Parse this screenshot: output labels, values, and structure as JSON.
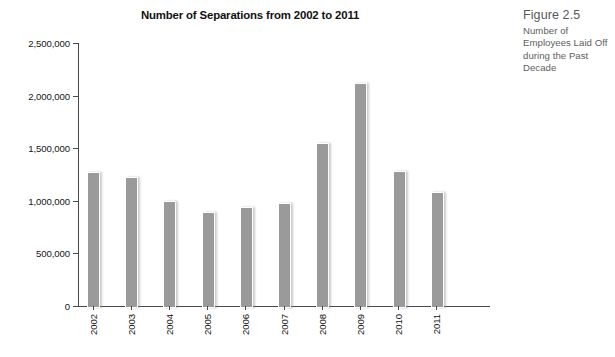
{
  "caption": {
    "figure_label": "Figure 2.5",
    "description": "Number of Employees Laid Off during the Past Decade"
  },
  "chart_data": {
    "type": "bar",
    "title": "Number of Separations from 2002 to 2011",
    "xlabel": "",
    "ylabel": "",
    "categories": [
      "2002",
      "2003",
      "2004",
      "2005",
      "2006",
      "2007",
      "2008",
      "2009",
      "2010",
      "2011"
    ],
    "values": [
      1275000,
      1225000,
      1000000,
      890000,
      940000,
      975000,
      1545000,
      2120000,
      1285000,
      1085000
    ],
    "ylim": [
      0,
      2500000
    ],
    "ytick_values": [
      0,
      500000,
      1000000,
      1500000,
      2000000,
      2500000
    ],
    "ytick_labels": [
      "0",
      "500,000",
      "1,000,000",
      "1,500,000",
      "2,000,000",
      "2,500,000"
    ],
    "grid": false,
    "legend": null,
    "bar_color": "#9a9a9a",
    "axis_color": "#4a4a4a"
  }
}
